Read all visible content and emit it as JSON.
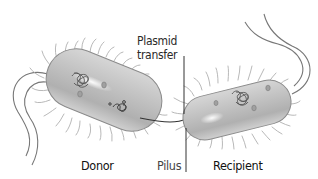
{
  "diagram": {
    "labels": {
      "plasmid_transfer_line1": "Plasmid",
      "plasmid_transfer_line2": "transfer",
      "donor": "Donor",
      "pilus": "Pilus",
      "recipient": "Recipient"
    },
    "cells": [
      {
        "name": "donor",
        "role": "Donor",
        "has_plasmid": true,
        "flagella": 2
      },
      {
        "name": "recipient",
        "role": "Recipient",
        "has_plasmid": false,
        "flagella": 2
      }
    ],
    "colors": {
      "cell_body": "#bdbdbd",
      "cell_outline": "#8a8a8a",
      "hair": "#a8a8a8",
      "flagella": "#6e6e6e",
      "text": "#1a1a1a",
      "leader_line": "#333333"
    }
  }
}
